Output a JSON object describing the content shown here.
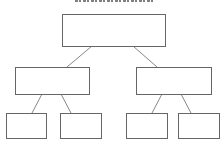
{
  "diagram": {
    "type": "tree",
    "title_visible": "clipped",
    "colors": {
      "border": "#666666",
      "edge": "#888888",
      "background": "#ffffff"
    },
    "nodes": [
      {
        "id": "root",
        "level": 0,
        "label": "",
        "x": 62,
        "y": 14,
        "w": 104,
        "h": 33
      },
      {
        "id": "left",
        "level": 1,
        "label": "",
        "x": 15,
        "y": 67,
        "w": 75,
        "h": 28
      },
      {
        "id": "right",
        "level": 1,
        "label": "",
        "x": 136,
        "y": 67,
        "w": 76,
        "h": 28
      },
      {
        "id": "left-left",
        "level": 2,
        "label": "",
        "x": 6,
        "y": 113,
        "w": 41,
        "h": 26
      },
      {
        "id": "left-right",
        "level": 2,
        "label": "",
        "x": 60,
        "y": 113,
        "w": 42,
        "h": 26
      },
      {
        "id": "right-left",
        "level": 2,
        "label": "",
        "x": 126,
        "y": 113,
        "w": 42,
        "h": 26
      },
      {
        "id": "right-right",
        "level": 2,
        "label": "",
        "x": 178,
        "y": 113,
        "w": 42,
        "h": 26
      }
    ],
    "edges": [
      {
        "from": "root",
        "to": "left",
        "x1": 92,
        "y1": 46,
        "x2": 67,
        "y2": 67
      },
      {
        "from": "root",
        "to": "right",
        "x1": 133,
        "y1": 46,
        "x2": 157,
        "y2": 67
      },
      {
        "from": "left",
        "to": "left-left",
        "x1": 42,
        "y1": 94,
        "x2": 32,
        "y2": 113
      },
      {
        "from": "left",
        "to": "left-right",
        "x1": 61,
        "y1": 94,
        "x2": 71,
        "y2": 113
      },
      {
        "from": "right",
        "to": "right-left",
        "x1": 162,
        "y1": 94,
        "x2": 152,
        "y2": 113
      },
      {
        "from": "right",
        "to": "right-right",
        "x1": 181,
        "y1": 94,
        "x2": 191,
        "y2": 113
      }
    ]
  }
}
